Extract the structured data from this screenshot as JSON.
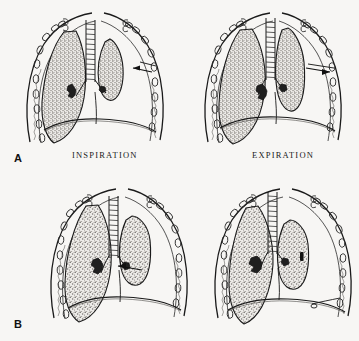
{
  "figure": {
    "background_color": "#f7f6f4",
    "ink_color": "#1a1a1a",
    "lung_fill_color": "#b9b6b2",
    "width": 359,
    "height": 341
  },
  "panels": [
    {
      "id": "A-inspiration",
      "letter": "",
      "caption": "INSPIRATION",
      "row": 0,
      "col": 0,
      "description": "Thorax in inspiration; mediastinum and trachea shift toward uninjured side; injured chest wall segment moves inward",
      "marker": "black-arrow-right-chest-wall"
    },
    {
      "id": "A-expiration",
      "letter": "",
      "caption": "EXPIRATION",
      "row": 0,
      "col": 1,
      "description": "Thorax in expiration; mediastinum swings back; flail segment moves outward",
      "marker": "black-arrow-right-chest-wall"
    },
    {
      "id": "B-inspiration",
      "letter": "",
      "caption": "",
      "row": 1,
      "col": 0,
      "description": "Lower series inspiration; collapsed right lung, mediastinal shift",
      "marker": "black-arrow-left-lung"
    },
    {
      "id": "B-expiration",
      "letter": "",
      "caption": "",
      "row": 1,
      "col": 1,
      "description": "Lower series expiration; mediastinum returns, air shifts",
      "marker": "black-wedge-lung"
    }
  ],
  "labels": {
    "inspiration": "INSPIRATION",
    "expiration": "EXPIRATION",
    "panel_a": "A",
    "panel_b": "B"
  },
  "anatomy": {
    "trachea": "trachea-with-cartilage-rings",
    "ribs": "rib-cross-sections-ovals",
    "diaphragm": "diaphragm-dome-curve",
    "lungs": "stippled-lung-fields",
    "heart": "cardiac-silhouette",
    "hilum": "hilar-bronchus-marking"
  }
}
